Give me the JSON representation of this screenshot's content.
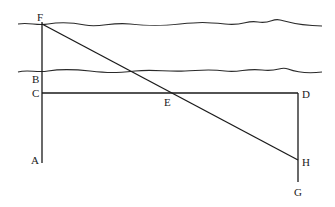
{
  "diagram": {
    "type": "geometric-construction",
    "colors": {
      "ink": "#1a1a1a",
      "background": "#ffffff"
    },
    "labels": {
      "F": "F",
      "B": "B",
      "C": "C",
      "A": "A",
      "E": "E",
      "D": "D",
      "H": "H",
      "G": "G"
    },
    "points": {
      "F": [
        42,
        24
      ],
      "B": [
        42,
        71
      ],
      "C": [
        42,
        93
      ],
      "A": [
        42,
        162
      ],
      "E": [
        170,
        93
      ],
      "D": [
        298,
        93
      ],
      "H": [
        298,
        160
      ],
      "G": [
        298,
        182
      ]
    },
    "segments": [
      [
        "F",
        "A"
      ],
      [
        "C",
        "D"
      ],
      [
        "D",
        "G"
      ],
      [
        "F",
        "H"
      ]
    ],
    "banks": [
      "top-bank",
      "bottom-bank"
    ]
  }
}
